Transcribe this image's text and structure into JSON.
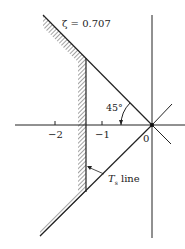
{
  "diagram": {
    "zeta_label": "ζ = 0.707",
    "angle_label": "45°",
    "tick_labels": [
      "−2",
      "−1",
      "0"
    ],
    "ts_label_main": "T",
    "ts_label_sub": "s",
    "ts_label_tail": " line",
    "colors": {
      "line": "#222222",
      "background": "#ffffff"
    }
  }
}
